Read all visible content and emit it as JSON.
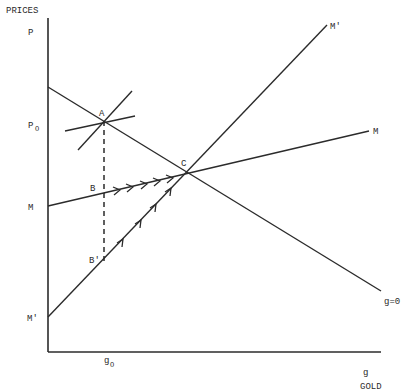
{
  "diagram": {
    "axes": {
      "y_title": "PRICES",
      "y_var": "P",
      "x_title": "GOLD",
      "x_var": "g"
    },
    "y_ticks": {
      "p0": "P",
      "p0_sub": "O",
      "m": "M",
      "m_prime": "M'"
    },
    "x_ticks": {
      "g0": "g",
      "g0_sub": "O"
    },
    "curves": {
      "g_zero": "g=0",
      "m": "M",
      "m_prime": "M'"
    },
    "points": {
      "a": "A",
      "b": "B",
      "b_prime": "B'",
      "c": "C"
    },
    "colors": {
      "ink": "#2b2b2b",
      "background": "#ffffff"
    }
  }
}
